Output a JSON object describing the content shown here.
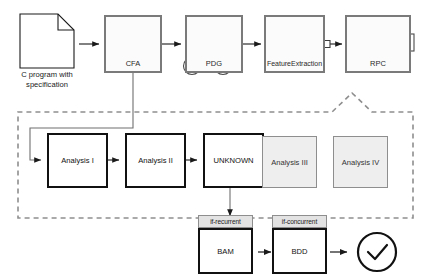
{
  "diagram": {
    "source_document": {
      "caption_line1": "C program with",
      "caption_line2": "specification",
      "icon": "document-page-icon"
    },
    "pipeline_stages": [
      {
        "id": "cfa",
        "label": "CFA",
        "glyph": "two-node-loop-graph"
      },
      {
        "id": "pdg",
        "label": "PDG",
        "glyph": "four-node-dependence-graph"
      },
      {
        "id": "featureextraction",
        "label": "FeatureExtraction",
        "glyph": "pentagon-clique-funnel"
      },
      {
        "id": "rpc",
        "label": "RPC",
        "glyph": "three-square-chain"
      }
    ],
    "analysis_row": [
      {
        "id": "analysis-1",
        "label": "Analysis I",
        "state": "active"
      },
      {
        "id": "analysis-2",
        "label": "Analysis II",
        "state": "active"
      },
      {
        "id": "unknown",
        "label": "UNKNOWN",
        "state": "active"
      },
      {
        "id": "analysis-3",
        "label": "Analysis III",
        "state": "inactive"
      },
      {
        "id": "analysis-4",
        "label": "Analysis IV",
        "state": "inactive"
      }
    ],
    "decision_row": [
      {
        "id": "bam",
        "condition": "if-recurrent",
        "label": "BAM"
      },
      {
        "id": "bdd",
        "condition": "if-concurrent",
        "label": "BDD"
      }
    ],
    "result": {
      "id": "result-check",
      "icon": "check-circle-icon",
      "label": ""
    },
    "colors": {
      "stage_border": "#7a7a7a",
      "active_border": "#111111",
      "inactive_border": "#8e8e8e",
      "inactive_fill": "#eeeeee",
      "tag_fill": "#e3e3e3",
      "dashed_group": "#8e8e8e",
      "arrow": "#1a1a1a"
    }
  }
}
